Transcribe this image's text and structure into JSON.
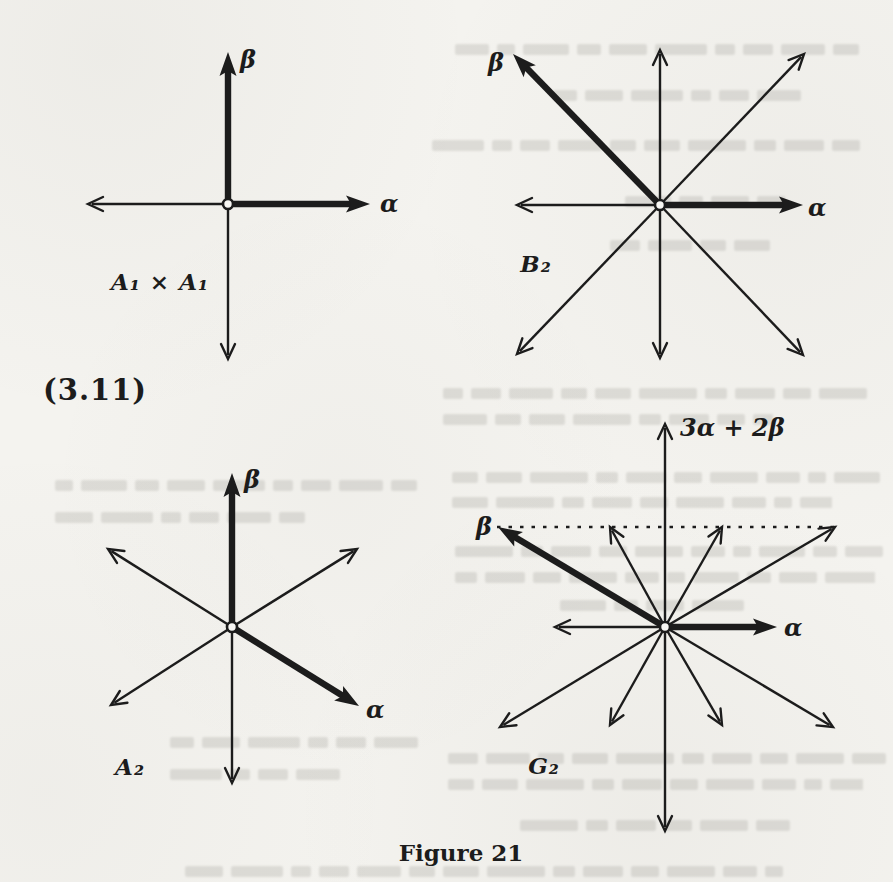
{
  "page": {
    "equation_number": "(3.11)",
    "caption": "Figure 21"
  },
  "colors": {
    "ink": "#1c1c1c",
    "paper": "#f4f3ef"
  },
  "figure": {
    "diagrams": [
      {
        "id": "a1xa1",
        "label": "A₁ × A₁",
        "label_pos": {
          "x": 160,
          "y": 281
        },
        "center": {
          "x": 228,
          "y": 204
        },
        "arrows": [
          {
            "dx": 0,
            "dy": -152,
            "thick": true,
            "role": "beta"
          },
          {
            "dx": 142,
            "dy": 0,
            "thick": true,
            "role": "alpha"
          },
          {
            "dx": -140,
            "dy": 0,
            "thick": false,
            "role": "root"
          },
          {
            "dx": 0,
            "dy": 155,
            "thick": false,
            "role": "root"
          }
        ],
        "vector_labels": [
          {
            "text": "β",
            "x": 240,
            "y": 60,
            "align": "left"
          },
          {
            "text": "α",
            "x": 380,
            "y": 204,
            "align": "left"
          }
        ]
      },
      {
        "id": "b2",
        "label": "B₂",
        "label_pos": {
          "x": 536,
          "y": 263
        },
        "center": {
          "x": 660,
          "y": 205
        },
        "arrows": [
          {
            "dx": 0,
            "dy": -155,
            "thick": false,
            "role": "root"
          },
          {
            "dx": 0,
            "dy": 153,
            "thick": false,
            "role": "root"
          },
          {
            "dx": 143,
            "dy": 0,
            "thick": true,
            "role": "alpha"
          },
          {
            "dx": -143,
            "dy": 0,
            "thick": false,
            "role": "root"
          },
          {
            "dx": -147,
            "dy": -151,
            "thick": true,
            "role": "beta"
          },
          {
            "dx": 144,
            "dy": -151,
            "thick": false,
            "role": "root"
          },
          {
            "dx": -143,
            "dy": 149,
            "thick": false,
            "role": "root"
          },
          {
            "dx": 143,
            "dy": 150,
            "thick": false,
            "role": "root"
          }
        ],
        "vector_labels": [
          {
            "text": "β",
            "x": 504,
            "y": 63,
            "align": "right"
          },
          {
            "text": "α",
            "x": 808,
            "y": 208,
            "align": "left"
          }
        ]
      },
      {
        "id": "a2",
        "label": "A₂",
        "label_pos": {
          "x": 130,
          "y": 766
        },
        "center": {
          "x": 232,
          "y": 627
        },
        "arrows": [
          {
            "dx": 0,
            "dy": -154,
            "thick": true,
            "role": "beta"
          },
          {
            "dx": 127,
            "dy": 79,
            "thick": true,
            "role": "alpha"
          },
          {
            "dx": 125,
            "dy": -78,
            "thick": false,
            "role": "root"
          },
          {
            "dx": -124,
            "dy": -78,
            "thick": false,
            "role": "root"
          },
          {
            "dx": -121,
            "dy": 78,
            "thick": false,
            "role": "root"
          },
          {
            "dx": 0,
            "dy": 156,
            "thick": false,
            "role": "root"
          }
        ],
        "vector_labels": [
          {
            "text": "β",
            "x": 244,
            "y": 480,
            "align": "left"
          },
          {
            "text": "α",
            "x": 366,
            "y": 710,
            "align": "left"
          }
        ]
      },
      {
        "id": "g2",
        "label": "G₂",
        "label_pos": {
          "x": 544,
          "y": 765
        },
        "center": {
          "x": 665,
          "y": 627
        },
        "dashed_guide": {
          "x1": 497,
          "y1": 527,
          "x2": 836,
          "y2": 527
        },
        "arrows": [
          {
            "dx": 0,
            "dy": -203,
            "thick": false,
            "role": "highest-root"
          },
          {
            "dx": 0,
            "dy": 204,
            "thick": false,
            "role": "root"
          },
          {
            "dx": -167,
            "dy": -100,
            "thick": true,
            "role": "beta"
          },
          {
            "dx": 170,
            "dy": -100,
            "thick": false,
            "role": "root"
          },
          {
            "dx": -165,
            "dy": 100,
            "thick": false,
            "role": "root"
          },
          {
            "dx": 168,
            "dy": 100,
            "thick": false,
            "role": "root"
          },
          {
            "dx": 112,
            "dy": 0,
            "thick": true,
            "role": "alpha"
          },
          {
            "dx": -110,
            "dy": 0,
            "thick": false,
            "role": "root"
          },
          {
            "dx": 57,
            "dy": -100,
            "thick": false,
            "role": "root"
          },
          {
            "dx": -55,
            "dy": -100,
            "thick": false,
            "role": "root"
          },
          {
            "dx": -55,
            "dy": 98,
            "thick": false,
            "role": "root"
          },
          {
            "dx": 57,
            "dy": 98,
            "thick": false,
            "role": "root"
          }
        ],
        "vector_labels": [
          {
            "text": "3α + 2β",
            "x": 680,
            "y": 428,
            "align": "left"
          },
          {
            "text": "β",
            "x": 492,
            "y": 527,
            "align": "right"
          },
          {
            "text": "α",
            "x": 784,
            "y": 628,
            "align": "left"
          }
        ]
      }
    ]
  }
}
